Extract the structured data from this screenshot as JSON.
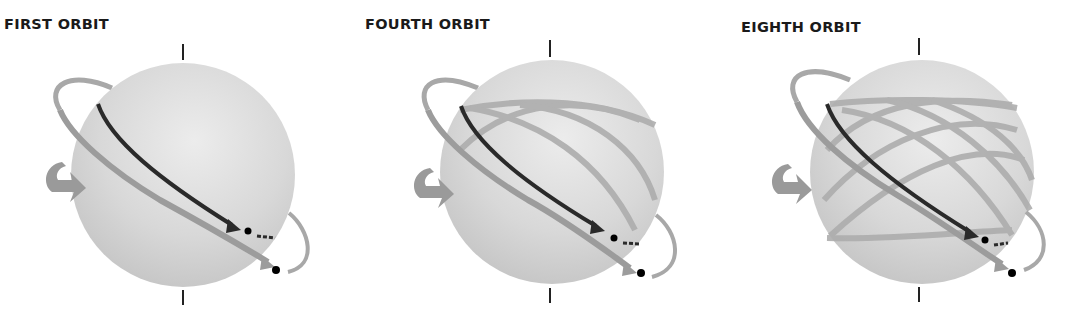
{
  "panels": [
    {
      "title": "FIRST ORBIT",
      "orbits_shown": 1
    },
    {
      "title": "FOURTH ORBIT",
      "orbits_shown": 4
    },
    {
      "title": "EIGHTH ORBIT",
      "orbits_shown": 8
    }
  ],
  "colors": {
    "sphere": "#d9d9d9",
    "orbit_track": "#a8a8a8",
    "current_path": "#2a2a2a",
    "satellite": "#000000",
    "rotation_arrow": "#9a9a9a"
  }
}
